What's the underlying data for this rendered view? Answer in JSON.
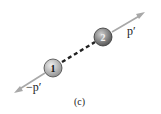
{
  "diagram": {
    "caption": "(c)",
    "particles": [
      {
        "id": "1",
        "label": "1",
        "cx": 53,
        "cy": 68,
        "r": 9,
        "fill": "#b9b9b9"
      },
      {
        "id": "2",
        "label": "2",
        "cx": 103,
        "cy": 37,
        "r": 9,
        "fill": "#8a8a8a"
      }
    ],
    "momenta": [
      {
        "particle": "1",
        "label": "−p′",
        "to": [
          15,
          92
        ]
      },
      {
        "particle": "2",
        "label": "p′",
        "to": [
          144,
          13
        ]
      }
    ],
    "bond": {
      "style": "dashed",
      "color": "#222222"
    },
    "colors": {
      "arrow": "#a8a8a8",
      "outline": "#333333"
    }
  }
}
